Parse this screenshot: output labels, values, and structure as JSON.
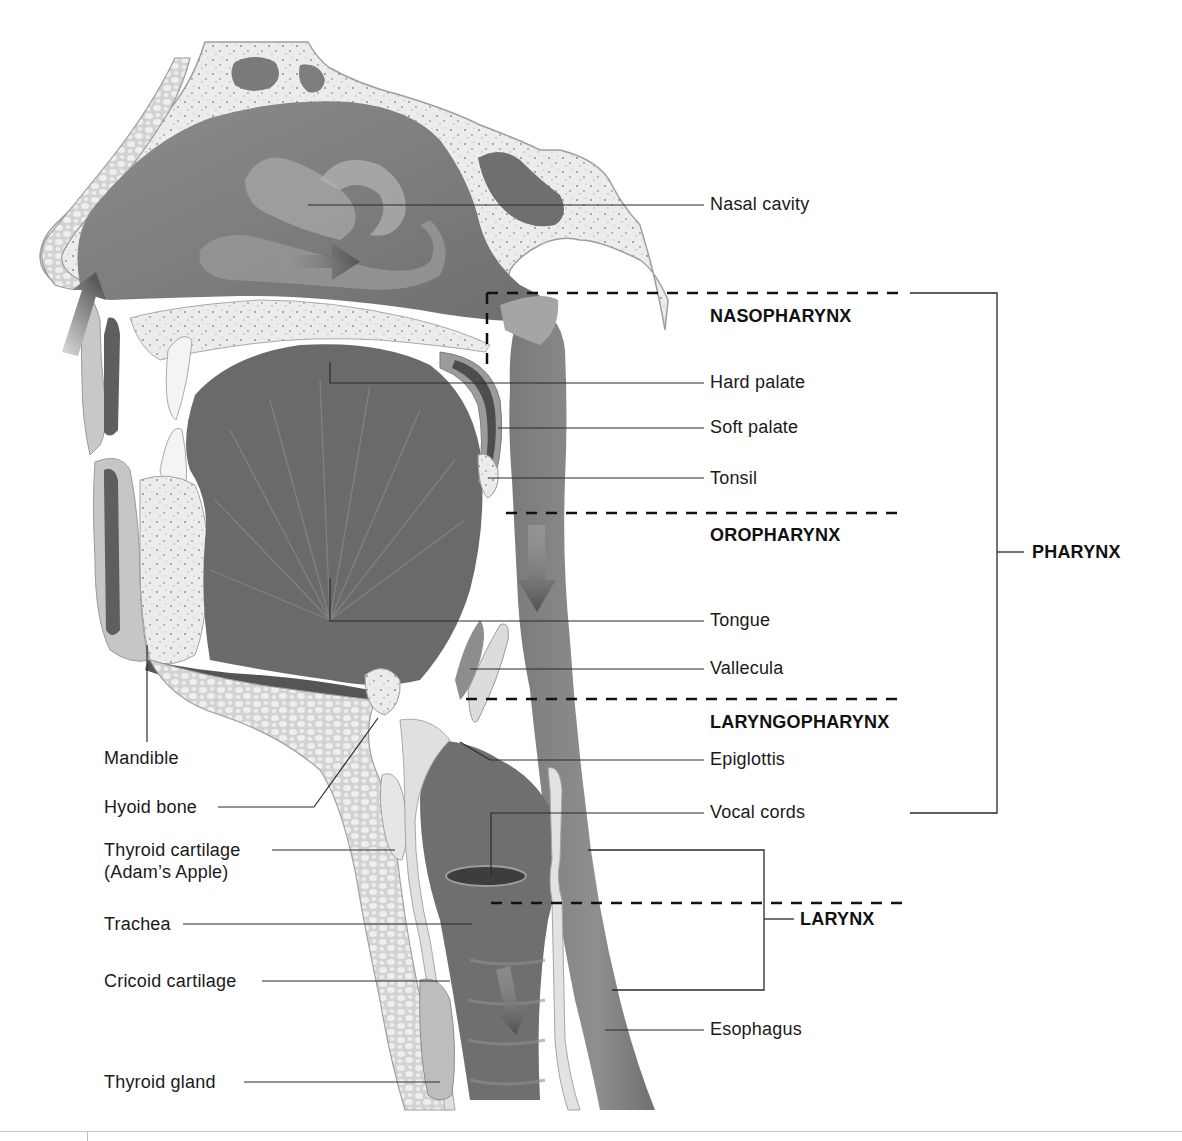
{
  "diagram": {
    "colors": {
      "bone_fill": "#e8e8e8",
      "bone_speckle": "#8a8a8a",
      "tissue_light": "#d6d6d6",
      "tissue_mid": "#a9a9a9",
      "cavity_dark": "#7b7b7b",
      "cavity_darker": "#5e5e5e",
      "arrow": "#6b6b6b",
      "leader_line": "#2a2a2a",
      "dashed_line": "#111111",
      "text": "#1a1a1a"
    },
    "labels_right": [
      {
        "id": "nasal-cavity",
        "text": "Nasal cavity"
      },
      {
        "id": "hard-palate",
        "text": "Hard palate"
      },
      {
        "id": "soft-palate",
        "text": "Soft palate"
      },
      {
        "id": "tonsil",
        "text": "Tonsil"
      },
      {
        "id": "tongue",
        "text": "Tongue"
      },
      {
        "id": "vallecula",
        "text": "Vallecula"
      },
      {
        "id": "epiglottis",
        "text": "Epiglottis"
      },
      {
        "id": "vocal-cords",
        "text": "Vocal cords"
      },
      {
        "id": "esophagus",
        "text": "Esophagus"
      }
    ],
    "labels_left": [
      {
        "id": "mandible",
        "text": "Mandible"
      },
      {
        "id": "hyoid-bone",
        "text": "Hyoid bone"
      },
      {
        "id": "thyroid-cartilage",
        "text": "Thyroid cartilage"
      },
      {
        "id": "adams-apple",
        "text": "(Adam’s Apple)"
      },
      {
        "id": "trachea",
        "text": "Trachea"
      },
      {
        "id": "cricoid-cartilage",
        "text": "Cricoid cartilage"
      },
      {
        "id": "thyroid-gland",
        "text": "Thyroid gland"
      }
    ],
    "regions": [
      {
        "id": "nasopharynx",
        "text": "NASOPHARYNX"
      },
      {
        "id": "oropharynx",
        "text": "OROPHARYNX"
      },
      {
        "id": "laryngopharynx",
        "text": "LARYNGOPHARYNX"
      }
    ],
    "groups": [
      {
        "id": "pharynx",
        "text": "PHARYNX"
      },
      {
        "id": "larynx",
        "text": "LARYNX"
      }
    ],
    "arrows": [
      {
        "id": "airflow-nostril",
        "direction": "up-right"
      },
      {
        "id": "airflow-nasal",
        "direction": "right"
      },
      {
        "id": "flow-pharynx",
        "direction": "down"
      },
      {
        "id": "flow-trachea",
        "direction": "down"
      }
    ]
  }
}
